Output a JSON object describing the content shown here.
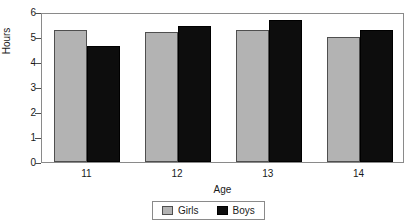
{
  "chart_data": {
    "type": "bar",
    "title": "",
    "xlabel": "Age",
    "ylabel": "Hours",
    "categories": [
      "11",
      "12",
      "13",
      "14"
    ],
    "series": [
      {
        "name": "Girls",
        "color": "#b3b3b3",
        "values": [
          5.3,
          5.2,
          5.28,
          5.0
        ]
      },
      {
        "name": "Boys",
        "color": "#0d0d0d",
        "values": [
          4.65,
          5.45,
          5.7,
          5.3
        ]
      }
    ],
    "ylim": [
      0,
      6
    ],
    "ytick_labels": [
      "6",
      "5",
      "4",
      "3",
      "2",
      "1",
      "0"
    ],
    "ytick_values": [
      6,
      5,
      4,
      3,
      2,
      1,
      0
    ],
    "grid": false,
    "legend_position": "bottom-center",
    "legend_entries": [
      "Girls",
      "Boys"
    ]
  }
}
